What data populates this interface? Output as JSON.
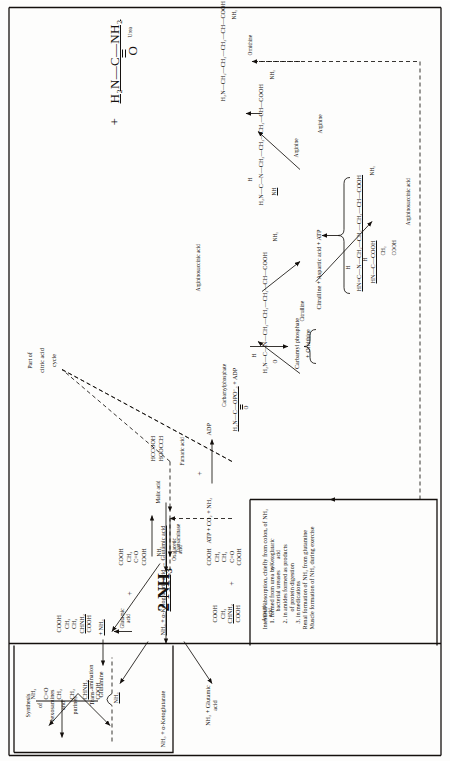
{
  "figure": {
    "orientation": "rotated-90-ccw"
  },
  "source_box": {
    "lines": [
      "Intestinal absorption, chiefly from colon, of NH₃",
      "1. formed from urea by",
      "bacterial ureases",
      "2. in amides formed as products",
      "of protein digestion",
      "3. in medications",
      "Renal formation of NH₃ from glutamine",
      "Muscle formation of NH₃ during exercise"
    ]
  },
  "glutamine_box": {
    "reaction_top": "NH₃ + α-Ketoglutarate",
    "reaction_bottom_l1": "NH₃ + Glutamic",
    "reaction_bottom_l2": "acid",
    "synthesis_l1": "Synthesis",
    "synthesis_l2": "of",
    "synthesis_l3": "hexosamines",
    "synthesis_l4": "and",
    "synthesis_l5": "purines",
    "glutamine_structure": [
      "NH₂",
      "C=O",
      "CH₂",
      "CH₂",
      "CHNH₂",
      "COOH"
    ],
    "glutamine_label": "Glutamine",
    "plus_nh3": "+ NH₃"
  },
  "flow": {
    "nh3_in": "NH₃",
    "two_nh3": "2 NH₃",
    "nh3_branch_up": "NH₃",
    "atp_co2_nh3": "ATP + CO₂ + NH₃",
    "adp": "ADP",
    "p_plus": "P +"
  },
  "transamination": {
    "reaction_line": "NH₃ + α-Ketoglutaric acid → Glutamic acid",
    "enzyme": "Transaminase",
    "bracket_label_l1": "Trans-",
    "bracket_label_l2": "amination",
    "aspartic_structure": [
      "COOH",
      "CH₂",
      "CHNH₂",
      "COOH"
    ],
    "aspartic_label_l1": "Aspartic",
    "aspartic_label_l2": "acid",
    "ketoglutaric_structure": [
      "COOH",
      "CH₂",
      "CH₂",
      "C=O",
      "COOH"
    ],
    "ketoglutaric_label_l1": "α-Ketoglutaric",
    "ketoglutaric_label_l2": "acid",
    "oxalacetic_structure": [
      "COOH",
      "CH₂",
      "C=O",
      "COOH"
    ],
    "oxalacetic_label_l1": "Oxalacetic",
    "oxalacetic_label_l2": "acid",
    "glutamic_structure": [
      "COOH",
      "CH₂",
      "CH₂",
      "CHNH₂",
      "COOH"
    ],
    "glutamic_label_l1": "Glutamic",
    "glutamic_label_l2": "acid",
    "plus": "+"
  },
  "carbamyl": {
    "title_l1": "Carbamylphosphate",
    "structure_main": "H₂N—C—OPO⁻₃",
    "structure_dbl": "O",
    "plus_adp": "+ ADP",
    "label_l1": "Carbamyl phosphate",
    "label_l2": "+ Ornithine"
  },
  "citrulline": {
    "structure_pre": "H₂N—C—N—CH₂—CH₂—CH₂—CH—COOH",
    "structure_o": "O",
    "structure_h": "H",
    "structure_nh2": "NH₂",
    "label": "Citrulline",
    "reaction": "Citrulline + Aspartic acid + ATP"
  },
  "argininosuccinic": {
    "label": "Argininosuccinic acid",
    "top_label": "Argininosuccinic acid",
    "lines": [
      "HN=C—N—CH₂—CH₂—CH₂—CH—COOH",
      "HN—C—COOH",
      "CH₂",
      "COOH",
      "NH₂",
      "H",
      "H"
    ]
  },
  "arginine": {
    "structure": "H₂N—C—N—CH₂—CH₂—CH₂—CH—COOH",
    "nh": "NH",
    "h": "H",
    "nh2": "NH₂",
    "label": "Arginine",
    "label2": "Arginine"
  },
  "ornithine": {
    "structure": "H₂N—CH₂—CH₂—CH₂—CH—COOH",
    "nh2": "NH₂",
    "label": "Ornithine"
  },
  "urea": {
    "plus": "+",
    "formula": "H₂N—C—NH₂",
    "dbl_o": "O",
    "label": "Urea"
  },
  "citric_cycle": {
    "label_l1": "Part of",
    "label_l2": "citric acid",
    "label_l3": "cycle",
    "malic": "Malic acid",
    "fumaric_l1": "HCCOOH",
    "fumaric_l2": "HOOCCH",
    "fumaric_label": "Fumaric acid",
    "plus": "+"
  },
  "colors": {
    "ink": "#14100d",
    "paper": "#fdfdfc"
  }
}
